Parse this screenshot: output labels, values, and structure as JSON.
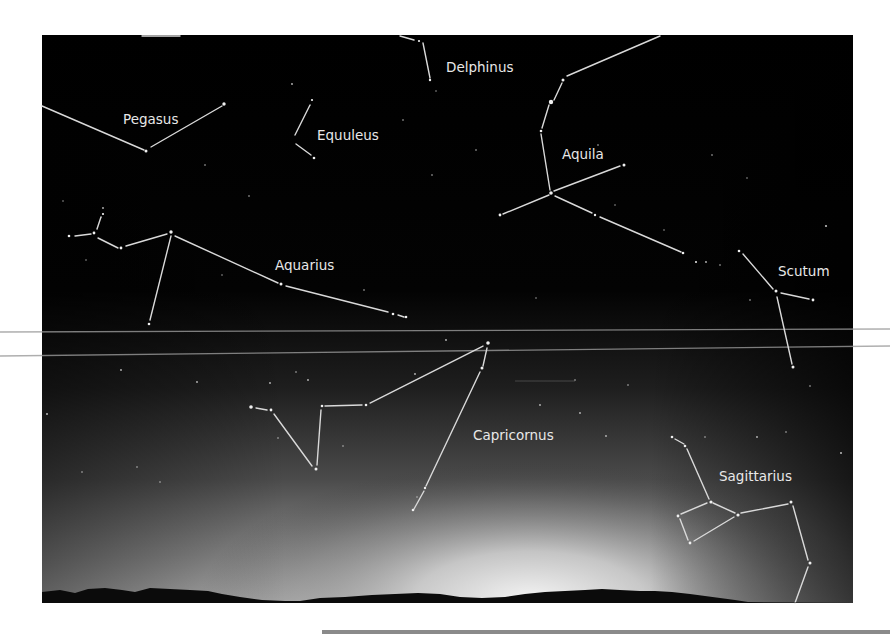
{
  "figure": {
    "colors": {
      "sky_top": "#000000",
      "sky_glow": "#d8d8d8",
      "line": "#d9d9d9",
      "label": "#e8e8e8",
      "horizon": "#0a0a0a",
      "page_bg": "#ffffff"
    },
    "constellations": [
      {
        "name": "Pegasus",
        "label_x": 123,
        "label_y": 124
      },
      {
        "name": "Equuleus",
        "label_x": 317,
        "label_y": 140
      },
      {
        "name": "Delphinus",
        "label_x": 446,
        "label_y": 72
      },
      {
        "name": "Aquila",
        "label_x": 562,
        "label_y": 159
      },
      {
        "name": "Aquarius",
        "label_x": 275,
        "label_y": 270
      },
      {
        "name": "Scutum",
        "label_x": 778,
        "label_y": 276
      },
      {
        "name": "Capricornus",
        "label_x": 473,
        "label_y": 440
      },
      {
        "name": "Sagittarius",
        "label_x": 719,
        "label_y": 481
      }
    ]
  }
}
